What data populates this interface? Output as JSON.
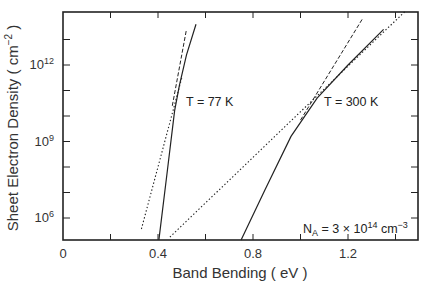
{
  "chart_data": {
    "type": "line",
    "title": "",
    "xlabel": "Band Bending ( eV )",
    "ylabel": "Sheet Electron Density ( cm^-2 )",
    "xlim": [
      0,
      1.49
    ],
    "ylim_log10": [
      5.14,
      14.05
    ],
    "yscale": "log",
    "grid": false,
    "x_ticks": [
      0,
      0.2,
      0.4,
      0.6,
      0.8,
      1.0,
      1.2,
      1.4
    ],
    "x_tick_labels": [
      {
        "value": 0,
        "label": "0"
      },
      {
        "value": 0.4,
        "label": "0.4"
      },
      {
        "value": 0.8,
        "label": "0.8"
      },
      {
        "value": 1.2,
        "label": "1.2"
      }
    ],
    "y_ticks_log10": [
      6,
      7,
      8,
      9,
      10,
      11,
      12,
      13
    ],
    "y_tick_labels": [
      {
        "log10": 6,
        "base": "10",
        "exp": "6"
      },
      {
        "log10": 9,
        "base": "10",
        "exp": "9"
      },
      {
        "log10": 12,
        "base": "10",
        "exp": "12"
      }
    ],
    "series": [
      {
        "name": "T = 77 K (solid)",
        "style": "solid",
        "points": [
          [
            0.404,
            5.14
          ],
          [
            0.44,
            7.9
          ],
          [
            0.47,
            10.2
          ],
          [
            0.49,
            11.2
          ],
          [
            0.52,
            12.4
          ],
          [
            0.56,
            13.6
          ]
        ]
      },
      {
        "name": "T = 77 K (dashed asymptote)",
        "style": "dashed",
        "points": [
          [
            0.46,
            10.4
          ],
          [
            0.52,
            13.4
          ]
        ]
      },
      {
        "name": "T = 77 K (dotted asymptote)",
        "style": "dotted",
        "points": [
          [
            0.33,
            5.57
          ],
          [
            0.5,
            11.5
          ]
        ]
      },
      {
        "name": "T = 300 K (solid)",
        "style": "solid",
        "points": [
          [
            0.75,
            5.14
          ],
          [
            0.85,
            7.1
          ],
          [
            0.96,
            9.2
          ],
          [
            1.07,
            10.7
          ],
          [
            1.2,
            12.0
          ],
          [
            1.35,
            13.4
          ]
        ]
      },
      {
        "name": "T = 300 K (dashed asymptote)",
        "style": "dashed",
        "points": [
          [
            1.0,
            9.84
          ],
          [
            1.26,
            13.8
          ]
        ]
      },
      {
        "name": "T = 300 K (dotted asymptote)",
        "style": "dotted",
        "points": [
          [
            0.45,
            5.25
          ],
          [
            1.44,
            14.1
          ]
        ]
      }
    ],
    "annotations": [
      {
        "text": "T = 77 K",
        "x": 0.5,
        "log10": 10.5
      },
      {
        "text": "T = 300 K",
        "x": 1.1,
        "log10": 10.5
      },
      {
        "text_base": "N",
        "text_sub": "A",
        "text_mid": " = 3 × 10",
        "text_sup": "14",
        "text_unit": " cm",
        "text_unit_sup": "−3"
      }
    ]
  },
  "labels": {
    "xlabel": "Band Bending ( eV )",
    "ylabel_main": "Sheet Electron Density ( cm",
    "ylabel_sup": "−2",
    "ylabel_close": " )",
    "t77": "T = 77 K",
    "t300": "T = 300 K",
    "na_N": "N",
    "na_sub": "A",
    "na_mid": " = 3 × 10",
    "na_sup": "14",
    "na_unit": " cm",
    "na_unit_sup": "−3"
  }
}
